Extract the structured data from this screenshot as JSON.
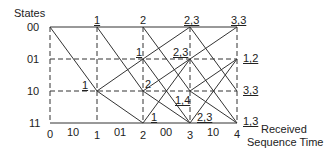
{
  "y_axis_title": "States",
  "states": [
    "00",
    "01",
    "10",
    "11"
  ],
  "times": [
    "0",
    "1",
    "2",
    "3",
    "4"
  ],
  "received_sequence": [
    "10",
    "01",
    "00",
    "10"
  ],
  "x_axis_title_line1": "Received",
  "x_axis_title_line2": "Sequence Time",
  "node_metrics": {
    "t1_s00": "1",
    "t1_s10": "1",
    "t2_s00": "2",
    "t2_s01": "1",
    "t2_s10": "2",
    "t2_s11": "1",
    "t3_s00": "2,3",
    "t3_s01": "2,3",
    "t3_s10": "1,4",
    "t3_s11": "2,3",
    "t4_s00": "3,3",
    "t4_s01": "1,2",
    "t4_s10": "3,3",
    "t4_s11": "1,3"
  }
}
